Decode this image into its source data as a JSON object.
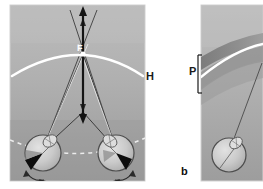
{
  "figure": {
    "background_color": "#ffffff"
  },
  "labels": {
    "horopter": "H",
    "panum": "P",
    "panel_b": "b",
    "fixation": "F"
  },
  "panels": {
    "left": {
      "name": "panel-a",
      "x": 10,
      "y": 5,
      "width": 135,
      "height": 176,
      "fill_top": "#b4b4b4",
      "fill_bottom": "#9a9a9a",
      "border_color": "#cfcfcf"
    },
    "right": {
      "name": "panel-b",
      "x": 201,
      "y": 5,
      "width": 62,
      "height": 176,
      "fill_top": "#b9b9b9",
      "fill_bottom": "#9d9d9d",
      "border_color": "#cfcfcf"
    }
  },
  "colors": {
    "horopter_curve": "#ffffff",
    "panum_band_dark": "#6e6e6e",
    "panum_band_mid": "#868686",
    "ray_dark": "#3a3a3a",
    "ray_light": "#efefef",
    "arrow": "#151515",
    "eye_outline": "#4a4a4a",
    "eye_fill": "#c9c9c9",
    "eye_fovea": "#0d0d0d",
    "dashed_curve": "#f2f2f2",
    "bracket": "#1a1a1a"
  },
  "elements": {
    "fixation_point": {
      "name": "fixation-point-F",
      "x": 83,
      "y": 54
    },
    "vertical_arrow": {
      "name": "vertical-double-arrow",
      "x": 83,
      "y_top": 8,
      "y_bottom": 122
    },
    "left_eye": {
      "name": "left-eye",
      "cx": 43,
      "cy": 153,
      "r": 18
    },
    "right_eye": {
      "name": "right-eye",
      "cx": 116,
      "cy": 153,
      "r": 18
    },
    "panel_b_eye": {
      "name": "panel-b-eye",
      "cx": 229,
      "cy": 155,
      "r": 17
    },
    "panum_bracket": {
      "name": "panum-bracket",
      "x": 197,
      "y_top": 55,
      "y_bottom": 93
    }
  }
}
